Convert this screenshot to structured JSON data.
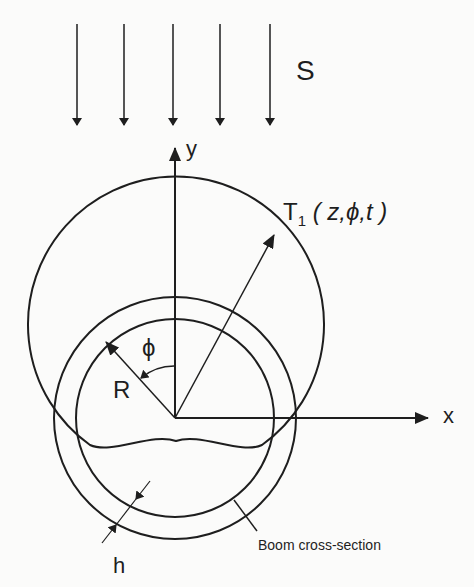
{
  "figure": {
    "type": "schematic",
    "flux_label": "S",
    "axes": {
      "x_label": "x",
      "y_label": "y"
    },
    "temperature_label": {
      "symbol": "T",
      "subscript": "1",
      "args": "( z,ϕ,t )"
    },
    "radius_label": "R",
    "angle_label": "ϕ",
    "thickness_label": "h",
    "cross_section_label": "Boom cross-section",
    "flux_arrow_count": 5,
    "colors": {
      "line": "#1e1e1e",
      "background": "#fbfbfa"
    }
  }
}
